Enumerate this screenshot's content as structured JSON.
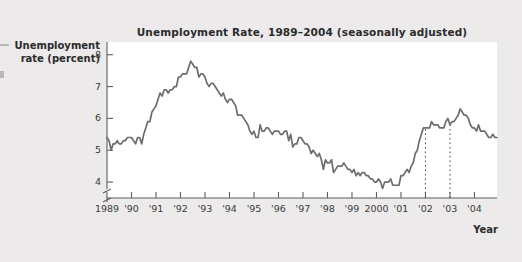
{
  "figure": {
    "name": "unemployment-rate-line-chart",
    "background_color": "#eceaea",
    "panel_color": "#ffffff",
    "line_color": "#6e6c6c"
  },
  "chart_data": {
    "type": "line",
    "title": "Unemployment Rate, 1989–2004 (seasonally adjusted)",
    "xlabel": "Year",
    "ylabel": "Unemployment rate (percent)",
    "ylabel_line1": "Unemployment",
    "ylabel_line2": "rate (percent)",
    "ylim": [
      3.5,
      8.4
    ],
    "yticks": [
      4,
      5,
      6,
      7,
      8
    ],
    "ytick_labels": [
      "4",
      "5",
      "6",
      "7",
      "8"
    ],
    "y_axis_break": true,
    "xlim": [
      1989.0,
      2004.92
    ],
    "xticks": [
      1989,
      1990,
      1991,
      1992,
      1993,
      1994,
      1995,
      1996,
      1997,
      1998,
      1999,
      2000,
      2001,
      2002,
      2003,
      2004
    ],
    "xtick_labels": [
      "1989",
      "'90",
      "'91",
      "'92",
      "'93",
      "'94",
      "'95",
      "'96",
      "'97",
      "'98",
      "'99",
      "2000",
      "'01",
      "'02",
      "'03",
      "'04"
    ],
    "grid": false,
    "legend": null,
    "annotations": [
      {
        "name": "reference-line-2002",
        "type": "vertical-dotted-line",
        "x": 2002,
        "label": "'02"
      },
      {
        "name": "reference-line-2003",
        "type": "vertical-dotted-line",
        "x": 2003,
        "label": "'03"
      }
    ],
    "series": [
      {
        "name": "Unemployment rate",
        "x_start": 1989.0,
        "x_step": 0.08333,
        "values": [
          5.4,
          5.3,
          5.0,
          5.2,
          5.2,
          5.3,
          5.2,
          5.2,
          5.3,
          5.3,
          5.4,
          5.4,
          5.4,
          5.3,
          5.2,
          5.4,
          5.4,
          5.2,
          5.5,
          5.7,
          5.9,
          5.9,
          6.2,
          6.3,
          6.4,
          6.6,
          6.8,
          6.7,
          6.9,
          6.9,
          6.8,
          6.9,
          6.9,
          7.0,
          7.0,
          7.3,
          7.3,
          7.4,
          7.4,
          7.4,
          7.6,
          7.8,
          7.7,
          7.6,
          7.6,
          7.3,
          7.4,
          7.4,
          7.3,
          7.1,
          7.0,
          7.1,
          7.1,
          7.0,
          6.9,
          6.8,
          6.7,
          6.8,
          6.6,
          6.5,
          6.6,
          6.6,
          6.5,
          6.4,
          6.1,
          6.1,
          6.1,
          6.0,
          5.9,
          5.8,
          5.6,
          5.5,
          5.6,
          5.4,
          5.4,
          5.8,
          5.6,
          5.6,
          5.7,
          5.7,
          5.6,
          5.5,
          5.6,
          5.6,
          5.6,
          5.5,
          5.5,
          5.6,
          5.6,
          5.3,
          5.5,
          5.1,
          5.2,
          5.2,
          5.4,
          5.4,
          5.3,
          5.2,
          5.2,
          5.1,
          4.9,
          5.0,
          4.9,
          4.8,
          4.9,
          4.7,
          4.4,
          4.7,
          4.6,
          4.6,
          4.7,
          4.3,
          4.4,
          4.5,
          4.5,
          4.5,
          4.6,
          4.5,
          4.4,
          4.4,
          4.3,
          4.4,
          4.2,
          4.3,
          4.2,
          4.3,
          4.3,
          4.2,
          4.2,
          4.1,
          4.1,
          4.0,
          4.0,
          4.1,
          4.0,
          3.8,
          4.0,
          4.0,
          4.0,
          4.1,
          3.9,
          3.9,
          3.9,
          3.9,
          4.2,
          4.2,
          4.3,
          4.4,
          4.3,
          4.5,
          4.6,
          4.9,
          5.0,
          5.3,
          5.5,
          5.7,
          5.7,
          5.7,
          5.7,
          5.9,
          5.8,
          5.8,
          5.8,
          5.7,
          5.7,
          5.7,
          5.9,
          6.0,
          5.8,
          5.9,
          5.9,
          6.0,
          6.1,
          6.3,
          6.2,
          6.1,
          6.1,
          6.0,
          5.8,
          5.7,
          5.7,
          5.6,
          5.8,
          5.6,
          5.6,
          5.6,
          5.5,
          5.4,
          5.4,
          5.5,
          5.4,
          5.4
        ]
      }
    ]
  }
}
